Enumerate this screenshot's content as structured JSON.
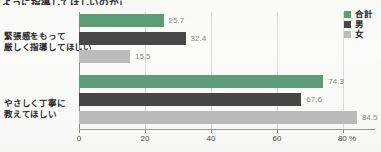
{
  "chart_data": {
    "type": "bar",
    "orientation": "horizontal",
    "title": "ように指導してほしいのか」",
    "xlabel": "%",
    "ylabel": "",
    "xlim": [
      0,
      90
    ],
    "ticks": [
      "0",
      "20",
      "40",
      "60",
      "80 %"
    ],
    "tick_values": [
      0,
      20,
      40,
      60,
      80
    ],
    "grid": true,
    "legend_position": "top-right",
    "categories": [
      "緊張感をもって\n厳しく指導してほしい",
      "やさしく丁寧に\n教えてほしい"
    ],
    "series": [
      {
        "name": "合計",
        "color": "#5d9e78",
        "values": [
          25.7,
          74.3
        ]
      },
      {
        "name": "男",
        "color": "#474747",
        "values": [
          32.4,
          67.6
        ]
      },
      {
        "name": "女",
        "color": "#bcbcbc",
        "values": [
          15.5,
          84.5
        ]
      }
    ]
  },
  "title": {
    "text": "ように指導してほしいのか」"
  },
  "legend": {
    "items": [
      {
        "label": "合計",
        "color": "#5d9e78"
      },
      {
        "label": "男",
        "color": "#474747"
      },
      {
        "label": "女",
        "color": "#bcbcbc"
      }
    ]
  },
  "categories": [
    {
      "line1": "緊張感をもって",
      "line2": "厳しく指導してほしい"
    },
    {
      "line1": "やさしく丁寧に",
      "line2": "教えてほしい"
    }
  ],
  "bars": [
    {
      "value": 25.7,
      "label": "25.7",
      "series": "合計",
      "category": "緊張感をもって厳しく指導してほしい"
    },
    {
      "value": 32.4,
      "label": "32.4",
      "series": "男",
      "category": "緊張感をもって厳しく指導してほしい"
    },
    {
      "value": 15.5,
      "label": "15.5",
      "series": "女",
      "category": "緊張感をもって厳しく指導してほしい"
    },
    {
      "value": 74.3,
      "label": "74.3",
      "series": "合計",
      "category": "やさしく丁寧に教えてほしい"
    },
    {
      "value": 67.6,
      "label": "67.6",
      "series": "男",
      "category": "やさしく丁寧に教えてほしい"
    },
    {
      "value": 84.5,
      "label": "84.5",
      "series": "女",
      "category": "やさしく丁寧に教えてほしい"
    }
  ],
  "axis": {
    "ticks": [
      {
        "label": "0",
        "value": 0
      },
      {
        "label": "20",
        "value": 20
      },
      {
        "label": "40",
        "value": 40
      },
      {
        "label": "60",
        "value": 60
      },
      {
        "label": "80 %",
        "value": 80
      }
    ]
  }
}
